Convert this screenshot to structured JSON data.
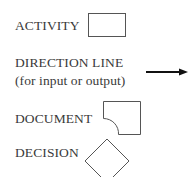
{
  "legend": {
    "items": [
      {
        "label": "ACTIVITY",
        "shape": "rectangle"
      },
      {
        "label": "DIRECTION LINE",
        "sublabel": "(for input or output)",
        "shape": "arrow"
      },
      {
        "label": "DOCUMENT",
        "shape": "document"
      },
      {
        "label": "DECISION",
        "shape": "diamond"
      }
    ]
  },
  "colors": {
    "stroke": "#555555",
    "arrow": "#111111",
    "text": "#3a3a3a"
  }
}
